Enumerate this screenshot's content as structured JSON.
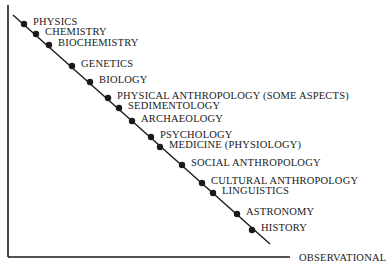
{
  "chart_data": {
    "type": "scatter",
    "title": "",
    "xlabel": "OBSERVATIONAL",
    "ylabel": "",
    "grid": false,
    "legend": null,
    "axes": {
      "y_axis": {
        "x": 8,
        "y1": 5,
        "y2": 257
      },
      "x_axis": {
        "y": 257,
        "x1": 8,
        "x2": 290
      },
      "diagonal": {
        "x1": 13,
        "y1": 15,
        "x2": 270,
        "y2": 244
      }
    },
    "points": [
      {
        "label": "PHYSICS",
        "x": 24,
        "y": 24
      },
      {
        "label": "CHEMISTRY",
        "x": 36,
        "y": 34
      },
      {
        "label": "BIOCHEMISTRY",
        "x": 49,
        "y": 45
      },
      {
        "label": "GENETICS",
        "x": 72,
        "y": 66
      },
      {
        "label": "BIOLOGY",
        "x": 90,
        "y": 82
      },
      {
        "label": "PHYSICAL ANTHROPOLOGY (SOME ASPECTS)",
        "x": 108,
        "y": 98
      },
      {
        "label": "SEDIMENTOLOGY",
        "x": 119,
        "y": 108
      },
      {
        "label": "ARCHAEOLOGY",
        "x": 132,
        "y": 121
      },
      {
        "label": "PSYCHOLOGY",
        "x": 151,
        "y": 137
      },
      {
        "label": "MEDICINE (PHYSIOLOGY)",
        "x": 160,
        "y": 147
      },
      {
        "label": "SOCIAL ANTHROPOLOGY",
        "x": 182,
        "y": 165
      },
      {
        "label": "CULTURAL ANTHROPOLOGY",
        "x": 202,
        "y": 183
      },
      {
        "label": "LINGUISTICS",
        "x": 213,
        "y": 193
      },
      {
        "label": "ASTRONOMY",
        "x": 237,
        "y": 214
      },
      {
        "label": "HISTORY",
        "x": 252,
        "y": 230
      }
    ]
  },
  "colors": {
    "ink": "#1a1a1a",
    "background": "#ffffff"
  }
}
